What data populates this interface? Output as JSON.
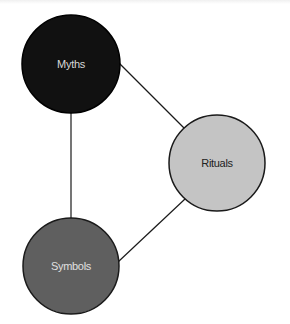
{
  "diagram": {
    "type": "network",
    "nodes": [
      {
        "id": "myths",
        "label": "Myths",
        "cx": 71,
        "cy": 64,
        "r": 49,
        "fill": "#111111",
        "stroke": "#000000",
        "text_color": "#d8d8d8"
      },
      {
        "id": "rituals",
        "label": "Rituals",
        "cx": 217,
        "cy": 163,
        "r": 48,
        "fill": "#c4c4c4",
        "stroke": "#1a1a1a",
        "text_color": "#222222"
      },
      {
        "id": "symbols",
        "label": "Symbols",
        "cx": 71,
        "cy": 266,
        "r": 48,
        "fill": "#5f5f5f",
        "stroke": "#1a1a1a",
        "text_color": "#e0e0e0"
      }
    ],
    "edges": [
      {
        "from": "myths",
        "to": "rituals"
      },
      {
        "from": "rituals",
        "to": "symbols"
      },
      {
        "from": "myths",
        "to": "symbols"
      }
    ],
    "edge_color": "#1a1a1a"
  }
}
